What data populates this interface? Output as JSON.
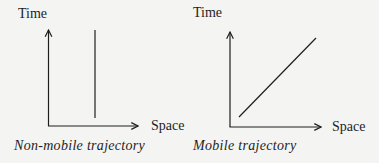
{
  "panels": [
    {
      "id": "non-mobile",
      "y_axis_label": "Time",
      "x_axis_label": "Space",
      "caption": "Non-mobile trajectory",
      "trajectory": "vertical line (no change in space over time)"
    },
    {
      "id": "mobile",
      "y_axis_label": "Time",
      "x_axis_label": "Space",
      "caption": "Mobile trajectory",
      "trajectory": "diagonal line (space changes with time)"
    }
  ],
  "colors": {
    "background": "#f4f4f2",
    "ink": "#1e1e1e"
  }
}
